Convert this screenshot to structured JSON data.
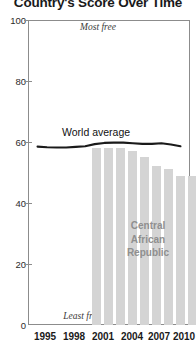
{
  "chart_data": {
    "type": "bar",
    "title": "Country's Score Over Time",
    "xlabel": "",
    "ylabel": "",
    "ylim": [
      0,
      100
    ],
    "xlim": [
      1994,
      2011
    ],
    "grid": false,
    "legend_position": "inline-annotation",
    "y_ticks": [
      "0",
      "20",
      "40",
      "60",
      "80",
      "100"
    ],
    "y_tick_values": [
      0,
      20,
      40,
      60,
      80,
      100
    ],
    "x_ticks": [
      "1995",
      "1998",
      "2001",
      "2004",
      "2007",
      "2010"
    ],
    "x_tick_values": [
      1995,
      1998,
      2001,
      2004,
      2007,
      2010
    ],
    "annotations": {
      "top_axis": "Most free",
      "bottom_axis": "Least free",
      "series_label": "World average",
      "bar_label_lines": [
        "Central",
        "African",
        "Republic"
      ],
      "bar_label_full": "Central African Republic"
    },
    "series": [
      {
        "name": "Central African Republic",
        "type": "bar",
        "color": "#d4d4d4",
        "x": [
          2001,
          2002,
          2003,
          2004,
          2005,
          2006,
          2007,
          2008,
          2009,
          2010
        ],
        "values": [
          58,
          58,
          58,
          57,
          55,
          52,
          51,
          49,
          49,
          49
        ]
      },
      {
        "name": "World average",
        "type": "line",
        "color": "#1a1a1a",
        "x": [
          1995,
          1996,
          1997,
          1998,
          1999,
          2000,
          2001,
          2002,
          2003,
          2004,
          2005,
          2006,
          2007,
          2008,
          2009,
          2010
        ],
        "values": [
          58.5,
          58.3,
          58.2,
          58.2,
          58.4,
          58.6,
          59.3,
          59.7,
          59.8,
          59.8,
          59.6,
          59.4,
          59.4,
          59.6,
          59.2,
          58.6
        ]
      }
    ]
  }
}
